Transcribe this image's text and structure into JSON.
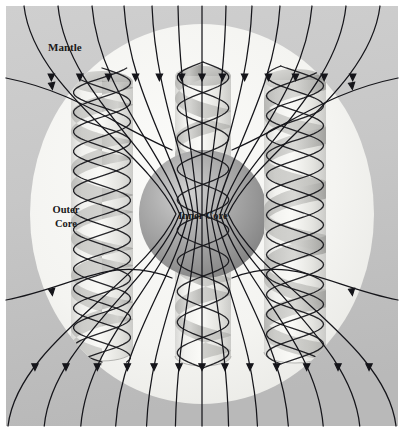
{
  "figure": {
    "canvas": {
      "width": 404,
      "height": 432
    },
    "margin": {
      "color": "#ffffff",
      "size": 6
    }
  },
  "labels": [
    {
      "id": "mantle",
      "text": "Mantle",
      "x": 48,
      "y": 51,
      "anchor": "start",
      "size": 11,
      "lines": [
        "Mantle"
      ]
    },
    {
      "id": "outer-core",
      "text": "Outer Core",
      "x": 66,
      "y": 213,
      "anchor": "middle",
      "size": 10.5,
      "lines": [
        "Outer",
        "Core"
      ]
    },
    {
      "id": "inner-core",
      "text": "Inner Core",
      "x": 203,
      "y": 219,
      "anchor": "middle",
      "size": 10.5,
      "lines": [
        "Inner Core"
      ]
    }
  ],
  "regions": {
    "mantle": {
      "name": "Mantle",
      "fill_top": "#c9c9c9",
      "fill_bottom": "#bdbdbd",
      "rect": {
        "x": 6,
        "y": 6,
        "width": 392,
        "height": 420
      }
    },
    "outer_core": {
      "name": "Outer Core",
      "fill_edge": "#e9e9e6",
      "fill_center": "#f6f6f3",
      "ellipse": {
        "cx": 202,
        "cy": 214,
        "rx": 172,
        "ry": 190
      }
    },
    "inner_core": {
      "name": "Inner Core",
      "fill_highlight": "#cfcfcf",
      "fill_mid": "#9d9d9d",
      "fill_edge": "#7d7d7d",
      "circle": {
        "cx": 203,
        "cy": 214,
        "r": 64
      },
      "highlight": {
        "fx": 0.38,
        "fy": 0.34
      }
    }
  },
  "columns": [
    {
      "id": "column-left",
      "cx": 102,
      "top": 82,
      "bottom": 350,
      "rx": 31,
      "ry": 11,
      "turns": 5,
      "phase": 0.0
    },
    {
      "id": "column-center",
      "cx": 203,
      "top": 76,
      "bottom": 356,
      "rx": 28,
      "ry": 10,
      "turns": 5,
      "phase": 0.5
    },
    {
      "id": "column-right",
      "cx": 295,
      "top": 80,
      "bottom": 352,
      "rx": 31,
      "ry": 11,
      "turns": 5,
      "phase": 0.25
    }
  ],
  "column_style": {
    "wall_light": "#f4f4f1",
    "wall_shade": "#d5d5d2",
    "ribbon_front": "#b9b9b6",
    "ribbon_back": "#8f8f8c",
    "cap_fill": "#cccccc",
    "cap_shade": "#9a9a9a"
  },
  "field_lines": {
    "name": "magnetic field lines",
    "stroke": "#15151a",
    "width": 1.25,
    "arrow_size": 4.0,
    "count": 20,
    "description": "Dipole magnetic field lines entering at the north (top) and exiting at the south (bottom), with directional arrowheads."
  },
  "twisted_lines": {
    "name": "twisted field lines in convection columns",
    "stroke": "#15151a",
    "width": 1.3,
    "description": "Field lines wound helically around each convection column by the rotating fluid."
  },
  "colors": {
    "mantle_gray": "#c9c9c9",
    "outer_core_white": "#f6f6f3",
    "inner_core_gray": "#9d9d9d",
    "line_black": "#15151a",
    "background": "#ffffff"
  }
}
